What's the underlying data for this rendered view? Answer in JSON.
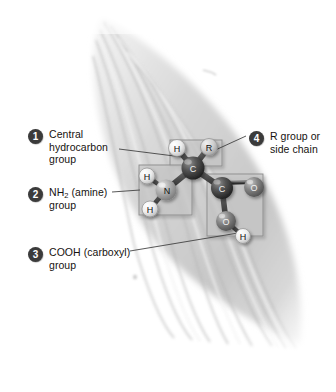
{
  "figure": {
    "background_shape": "muscle-fiber-bundle",
    "colors": {
      "badge_fill": "#3b3b3b",
      "badge_text": "#ffffff",
      "label_text": "#16120f",
      "leader_line": "#3a3a3a",
      "highlight_box_fill": "#c9c9c9",
      "highlight_box_stroke": "#8f8f8f",
      "carbon_atom": "#4a4a4a",
      "nitrogen_atom": "#a8a8a8",
      "oxygen_atom": "#7d7d7d",
      "hydrogen_atom": "#e8e8e8",
      "bond": "#555555",
      "background_fiber": "#cfcfcf"
    }
  },
  "callouts": [
    {
      "number": "1",
      "label": "Central\nhydrocarbon\ngroup",
      "target": "central-carbon"
    },
    {
      "number": "2",
      "label_pre": "NH",
      "label_sub": "2",
      "label_post": " (amine)\ngroup",
      "target": "amine-group"
    },
    {
      "number": "3",
      "label": "COOH (carboxyl)\ngroup",
      "target": "carboxyl-group"
    },
    {
      "number": "4",
      "label": "R group or\nside chain",
      "target": "r-group"
    }
  ],
  "molecule": {
    "name": "generic amino acid",
    "atoms": [
      {
        "id": "h-top",
        "symbol": "H",
        "element": "hydrogen",
        "x": 177,
        "y": 148,
        "r": 8.5
      },
      {
        "id": "r-group",
        "symbol": "R",
        "element": "r-group",
        "x": 209,
        "y": 147,
        "r": 8.5
      },
      {
        "id": "central-c",
        "symbol": "C",
        "element": "carbon",
        "x": 193,
        "y": 168,
        "r": 11.5
      },
      {
        "id": "n",
        "symbol": "N",
        "element": "nitrogen",
        "x": 166,
        "y": 190,
        "r": 10.5
      },
      {
        "id": "h-amine-up",
        "symbol": "H",
        "element": "hydrogen",
        "x": 147,
        "y": 176,
        "r": 8
      },
      {
        "id": "h-amine-down",
        "symbol": "H",
        "element": "hydrogen",
        "x": 150,
        "y": 209,
        "r": 8
      },
      {
        "id": "carboxyl-c",
        "symbol": "C",
        "element": "carbon",
        "x": 222,
        "y": 188,
        "r": 11
      },
      {
        "id": "o-double",
        "symbol": "O",
        "element": "oxygen",
        "x": 254,
        "y": 187,
        "r": 10
      },
      {
        "id": "o-hydroxyl",
        "symbol": "O",
        "element": "oxygen",
        "x": 226,
        "y": 221,
        "r": 10
      },
      {
        "id": "h-hydroxyl",
        "symbol": "H",
        "element": "hydrogen",
        "x": 243,
        "y": 236,
        "r": 7.5
      }
    ],
    "bonds": [
      {
        "from": "central-c",
        "to": "h-top",
        "order": "single"
      },
      {
        "from": "central-c",
        "to": "r-group",
        "order": "single"
      },
      {
        "from": "central-c",
        "to": "n",
        "order": "single"
      },
      {
        "from": "central-c",
        "to": "carboxyl-c",
        "order": "single"
      },
      {
        "from": "n",
        "to": "h-amine-up",
        "order": "single"
      },
      {
        "from": "n",
        "to": "h-amine-down",
        "order": "single"
      },
      {
        "from": "carboxyl-c",
        "to": "o-double",
        "order": "double"
      },
      {
        "from": "carboxyl-c",
        "to": "o-hydroxyl",
        "order": "single"
      },
      {
        "from": "o-hydroxyl",
        "to": "h-hydroxyl",
        "order": "single"
      }
    ],
    "highlight_boxes": [
      {
        "id": "box-r-group",
        "x": 170,
        "y": 140,
        "w": 52,
        "h": 26
      },
      {
        "id": "box-amine",
        "x": 139,
        "y": 165,
        "w": 53,
        "h": 50
      },
      {
        "id": "box-carboxyl",
        "x": 207,
        "y": 174,
        "w": 56,
        "h": 62
      }
    ],
    "leader_lines": [
      {
        "id": "leader-1",
        "x1": 119,
        "y1": 149,
        "x2": 190,
        "y2": 158
      },
      {
        "id": "leader-2",
        "x1": 112,
        "y1": 192,
        "x2": 140,
        "y2": 190
      },
      {
        "id": "leader-3",
        "x1": 130,
        "y1": 251,
        "x2": 244,
        "y2": 232
      },
      {
        "id": "leader-4",
        "x1": 246,
        "y1": 136,
        "x2": 211,
        "y2": 152
      }
    ]
  }
}
